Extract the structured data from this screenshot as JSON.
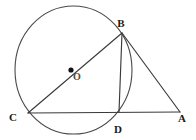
{
  "figure": {
    "canvas": {
      "width": 196,
      "height": 140,
      "background": "#ffffff"
    },
    "colors": {
      "line": "#3a3a3a",
      "circle": "#4a4a4a",
      "label": "#1a1a1a",
      "center_label": "#4d4d4d",
      "center_dot": "#111111"
    },
    "circle": {
      "name": "main-circle",
      "cx": 73.5,
      "cy": 70,
      "rx": 58.5,
      "ry": 64
    },
    "center": {
      "label": "O",
      "dot_x": 71,
      "dot_y": 70,
      "label_x": 77,
      "label_y": 80
    },
    "points": [
      {
        "id": "B",
        "label": "B",
        "x": 122,
        "y": 33,
        "label_x": 121,
        "label_y": 27
      },
      {
        "id": "C",
        "label": "C",
        "x": 28,
        "y": 113,
        "label_x": 13,
        "label_y": 121
      },
      {
        "id": "D",
        "label": "D",
        "x": 119,
        "y": 112,
        "label_x": 118,
        "label_y": 133
      },
      {
        "id": "A",
        "label": "A",
        "x": 180,
        "y": 112,
        "label_x": 182,
        "label_y": 122
      }
    ],
    "segments": [
      {
        "id": "CB",
        "name": "segment-cb-diameter",
        "from": "C",
        "to": "B"
      },
      {
        "id": "CA",
        "name": "segment-ca-base",
        "from": "C",
        "to": "A"
      },
      {
        "id": "BD",
        "name": "segment-bd-altitude",
        "from": "B",
        "to": "D"
      },
      {
        "id": "BA",
        "name": "segment-ba-tangent",
        "from": "B",
        "to": "A"
      }
    ]
  }
}
